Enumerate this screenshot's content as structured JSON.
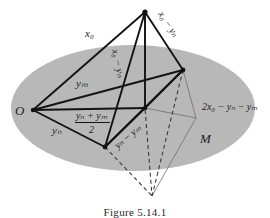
{
  "figure": {
    "region_label": "M",
    "origin_label": "O",
    "caption": "Figure 5.14.1",
    "colors": {
      "ellipse_fill": "#b8b8b8",
      "stroke_dark": "#141414",
      "stroke_thin": "#6f6f6f",
      "background": "#ffffff"
    },
    "labels": {
      "x0": {
        "base": "x",
        "sub": "0"
      },
      "x0_minus_yn_right": {
        "parts": [
          "x",
          "0",
          " − ",
          "y",
          "n"
        ]
      },
      "x0_minus_yn_center": {
        "parts": [
          "x",
          "0",
          " − ",
          "y",
          "n"
        ]
      },
      "ym": {
        "base": "y",
        "sub": "m"
      },
      "yn": {
        "base": "y",
        "sub": "n"
      },
      "yn_minus_ym": {
        "parts": [
          "y",
          "n",
          " − ",
          "y",
          "m"
        ]
      },
      "midpoint_numerator": {
        "parts": [
          "y",
          "n",
          " + ",
          "y",
          "m"
        ]
      },
      "midpoint_denominator": "2",
      "two_x0_minus_yn_minus_ym": {
        "parts": [
          "2",
          "x",
          "0",
          " − ",
          "y",
          "n",
          " − ",
          "y",
          "m"
        ]
      }
    },
    "text": {
      "x0": "x₀",
      "x0_minus_yn": "x₀ − yₙ",
      "ym": "yₘ",
      "yn": "yₙ",
      "yn_minus_ym": "yₙ − yₘ",
      "frac_num": "yₙ + yₘ",
      "frac_den": "2",
      "two_expr": "2x₀ − yₙ − yₘ",
      "M": "M",
      "O": "O",
      "caption": "Figure 5.14.1"
    },
    "vertices": {
      "apex_top": [
        145,
        12
      ],
      "origin_O": [
        33,
        110
      ],
      "right": [
        183,
        70
      ],
      "bottom_left": [
        105,
        147
      ],
      "center": [
        145,
        108
      ],
      "bottom_apex": [
        152,
        196
      ],
      "thin_right": [
        196,
        118
      ]
    }
  }
}
